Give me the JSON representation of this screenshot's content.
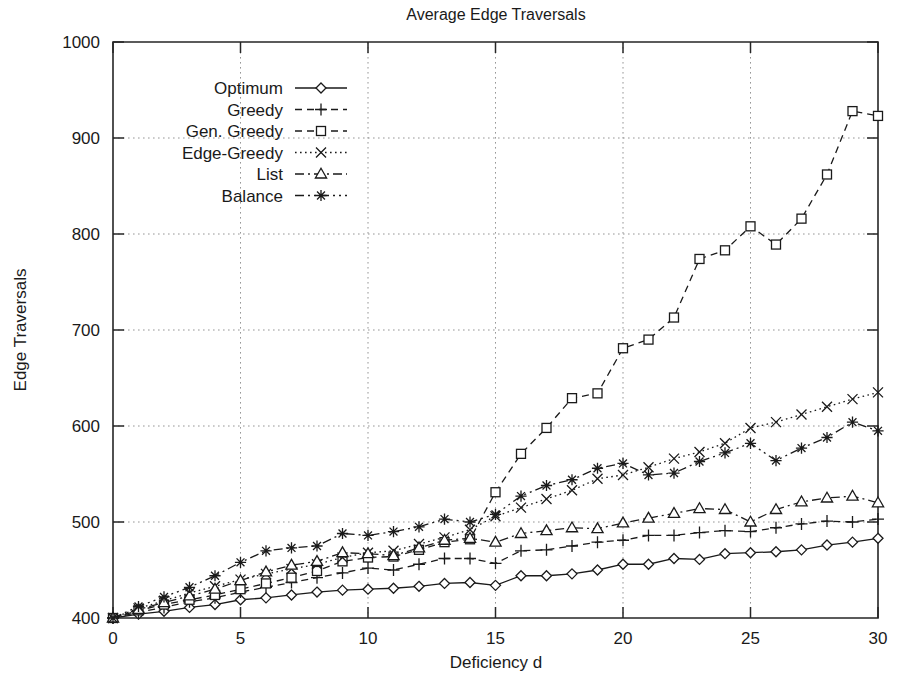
{
  "chart_data": {
    "type": "line",
    "title": "Average Edge Traversals",
    "xlabel": "Deficiency d",
    "ylabel": "Edge Traversals",
    "xlim": [
      0,
      30
    ],
    "ylim": [
      400,
      1000
    ],
    "xticks": [
      0,
      5,
      10,
      15,
      20,
      25,
      30
    ],
    "xtick_labels": [
      "0",
      "5",
      "10",
      "15",
      "20",
      "25",
      "30"
    ],
    "yticks": [
      400,
      500,
      600,
      700,
      800,
      900,
      1000
    ],
    "ytick_labels": [
      "400",
      "500",
      "600",
      "700",
      "800",
      "900",
      "1000"
    ],
    "grid": true,
    "legend_position": "top-left-inside",
    "x": [
      0,
      1,
      2,
      3,
      4,
      5,
      6,
      7,
      8,
      9,
      10,
      11,
      12,
      13,
      14,
      15,
      16,
      17,
      18,
      19,
      20,
      21,
      22,
      23,
      24,
      25,
      26,
      27,
      28,
      29,
      30
    ],
    "series": [
      {
        "name": "Optimum",
        "marker": "diamond",
        "dash": "solid",
        "values": [
          400,
          404,
          407,
          411,
          414,
          419,
          421,
          424,
          427,
          429,
          430,
          431,
          433,
          436,
          437,
          434,
          444,
          444,
          446,
          450,
          456,
          456,
          462,
          461,
          467,
          468,
          469,
          471,
          476,
          479,
          483
        ]
      },
      {
        "name": "Greedy",
        "marker": "plus",
        "dash": "dashed",
        "values": [
          400,
          406,
          411,
          417,
          421,
          427,
          432,
          437,
          442,
          447,
          452,
          450,
          456,
          462,
          462,
          457,
          470,
          471,
          475,
          479,
          481,
          486,
          486,
          489,
          491,
          490,
          494,
          498,
          501,
          500,
          503
        ]
      },
      {
        "name": "Gen. Greedy",
        "marker": "square",
        "dash": "dashed",
        "values": [
          400,
          408,
          414,
          419,
          424,
          430,
          436,
          442,
          449,
          459,
          463,
          464,
          471,
          479,
          482,
          531,
          571,
          598,
          629,
          634,
          681,
          690,
          713,
          774,
          783,
          808,
          789,
          816,
          862,
          928,
          923
        ]
      },
      {
        "name": "Edge-Greedy",
        "marker": "cross",
        "dash": "dotted",
        "values": [
          400,
          410,
          418,
          426,
          433,
          440,
          446,
          451,
          456,
          463,
          468,
          470,
          477,
          484,
          492,
          506,
          515,
          524,
          533,
          545,
          549,
          557,
          566,
          573,
          582,
          598,
          604,
          612,
          620,
          628,
          635
        ]
      },
      {
        "name": "List",
        "marker": "triangle",
        "dash": "dashdot",
        "values": [
          400,
          409,
          416,
          423,
          430,
          439,
          448,
          455,
          459,
          468,
          467,
          465,
          473,
          481,
          483,
          479,
          488,
          491,
          494,
          493,
          499,
          504,
          509,
          514,
          513,
          500,
          513,
          521,
          525,
          527,
          520
        ]
      },
      {
        "name": "Balance",
        "marker": "asterisk",
        "dash": "dashdotdot",
        "values": [
          400,
          412,
          422,
          432,
          444,
          458,
          470,
          473,
          475,
          488,
          486,
          490,
          495,
          503,
          500,
          508,
          527,
          538,
          544,
          556,
          561,
          549,
          551,
          563,
          572,
          582,
          564,
          577,
          588,
          604,
          595
        ]
      }
    ]
  },
  "legend": {
    "entries": [
      {
        "label": "Optimum"
      },
      {
        "label": "Greedy"
      },
      {
        "label": "Gen. Greedy"
      },
      {
        "label": "Edge-Greedy"
      },
      {
        "label": "List"
      },
      {
        "label": "Balance"
      }
    ]
  },
  "colors": {
    "ink": "#1a1a1a",
    "grid": "#8a8a8a",
    "background": "#ffffff"
  }
}
